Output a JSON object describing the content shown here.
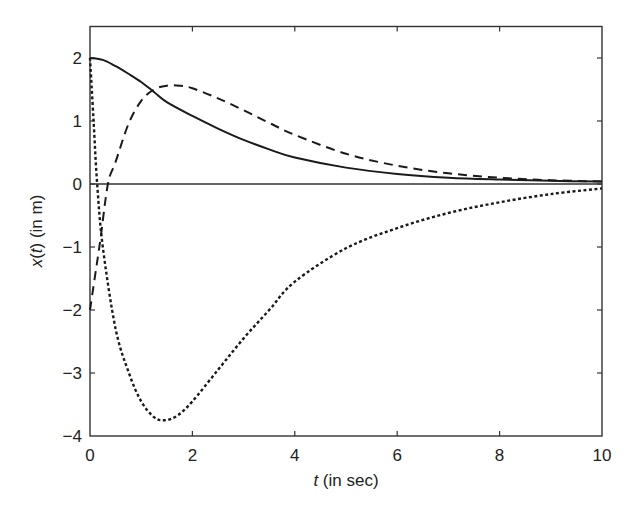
{
  "chart_data": {
    "type": "line",
    "title": "",
    "xlabel": "t (in sec)",
    "xlabel_parts": {
      "var": "t",
      "rest": " (in sec)"
    },
    "ylabel": "x(t) (in m)",
    "ylabel_parts": {
      "var1": "x",
      "mid": "(",
      "var2": "t",
      "rest": ") (in m)"
    },
    "xlim": [
      0,
      10
    ],
    "ylim": [
      -4,
      2.5
    ],
    "xticks": [
      0,
      2,
      4,
      6,
      8,
      10
    ],
    "xtick_labels": [
      "0",
      "2",
      "4",
      "6",
      "8",
      "10"
    ],
    "yticks": [
      2,
      1,
      0,
      -1,
      -2,
      -3,
      -4
    ],
    "ytick_labels": [
      "2",
      "1",
      "0",
      "−1",
      "−2",
      "−3",
      "−4"
    ],
    "grid": false,
    "legend": null,
    "zero_line": true,
    "series": [
      {
        "name": "solid",
        "style": "solid",
        "points": [
          [
            0,
            2.0
          ],
          [
            0.25,
            1.97
          ],
          [
            0.5,
            1.87
          ],
          [
            0.75,
            1.75
          ],
          [
            1,
            1.62
          ],
          [
            1.25,
            1.46
          ],
          [
            1.5,
            1.3
          ],
          [
            2,
            1.08
          ],
          [
            2.5,
            0.88
          ],
          [
            3,
            0.7
          ],
          [
            3.5,
            0.55
          ],
          [
            4,
            0.42
          ],
          [
            5,
            0.26
          ],
          [
            6,
            0.16
          ],
          [
            7,
            0.1
          ],
          [
            8,
            0.07
          ],
          [
            9,
            0.05
          ],
          [
            10,
            0.04
          ]
        ]
      },
      {
        "name": "dashed",
        "style": "dashed",
        "points": [
          [
            0,
            -2.0
          ],
          [
            0.1,
            -1.45
          ],
          [
            0.2,
            -0.9
          ],
          [
            0.35,
            0.0
          ],
          [
            0.5,
            0.35
          ],
          [
            0.75,
            0.95
          ],
          [
            1,
            1.32
          ],
          [
            1.25,
            1.5
          ],
          [
            1.5,
            1.56
          ],
          [
            1.75,
            1.56
          ],
          [
            2,
            1.52
          ],
          [
            2.5,
            1.36
          ],
          [
            3,
            1.17
          ],
          [
            3.5,
            0.97
          ],
          [
            4,
            0.78
          ],
          [
            5,
            0.48
          ],
          [
            6,
            0.29
          ],
          [
            7,
            0.17
          ],
          [
            8,
            0.1
          ],
          [
            9,
            0.06
          ],
          [
            10,
            0.04
          ]
        ]
      },
      {
        "name": "dotted",
        "style": "dotted",
        "points": [
          [
            0,
            2.0
          ],
          [
            0.07,
            1.0
          ],
          [
            0.14,
            0.0
          ],
          [
            0.25,
            -1.0
          ],
          [
            0.5,
            -2.3
          ],
          [
            0.76,
            -3.0
          ],
          [
            1,
            -3.45
          ],
          [
            1.25,
            -3.7
          ],
          [
            1.45,
            -3.75
          ],
          [
            1.7,
            -3.68
          ],
          [
            2,
            -3.45
          ],
          [
            2.5,
            -2.95
          ],
          [
            3,
            -2.45
          ],
          [
            3.5,
            -2.0
          ],
          [
            4,
            -1.55
          ],
          [
            5,
            -1.02
          ],
          [
            6,
            -0.7
          ],
          [
            7,
            -0.46
          ],
          [
            8,
            -0.29
          ],
          [
            9,
            -0.16
          ],
          [
            10,
            -0.07
          ]
        ]
      }
    ]
  }
}
